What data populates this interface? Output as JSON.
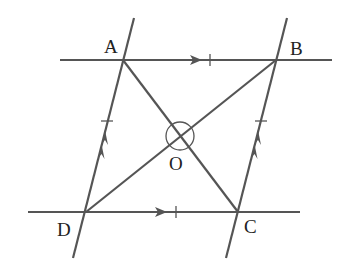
{
  "figure": {
    "type": "parallelogram-diagonals",
    "labels": {
      "A": "A",
      "B": "B",
      "C": "C",
      "D": "D",
      "O": "O"
    },
    "points": {
      "A": [
        123,
        60
      ],
      "B": [
        276,
        60
      ],
      "C": [
        238,
        212
      ],
      "D": [
        86,
        212
      ],
      "O": [
        180,
        136
      ]
    },
    "markings": {
      "AB_DC": "single arrow + single tick (parallel & equal)",
      "AD_BC": "double arrow + single tick (parallel & equal)",
      "angle_at_O": "full circle around O"
    },
    "colors": {
      "line": "#555555",
      "text": "#222222",
      "background": "#ffffff"
    }
  }
}
